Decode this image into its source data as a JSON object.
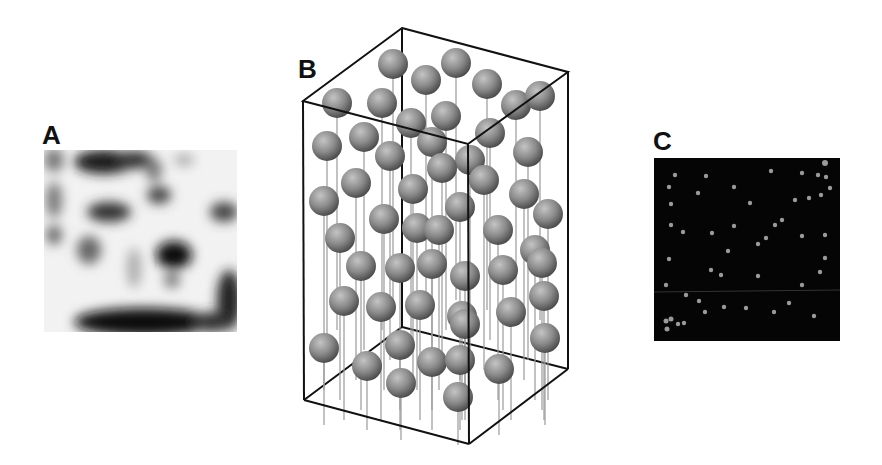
{
  "figure": {
    "panels": [
      {
        "id": "A",
        "label": "A",
        "description": "grayscale density map, light background with dark blobs"
      },
      {
        "id": "B",
        "label": "B",
        "description": "3D box containing spheres on vertical stalks"
      },
      {
        "id": "C",
        "label": "C",
        "description": "dark image with scattered bright dots"
      }
    ]
  },
  "colors": {
    "sphere": "#8a8a8a",
    "box_edge": "#111111",
    "panel_c_bg": "#050505",
    "dot": "#9a9a9a"
  }
}
